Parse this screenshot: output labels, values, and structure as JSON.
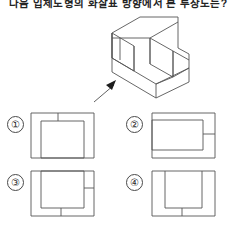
{
  "header": {
    "text": "다음 입체도형의 화살표 방향에서 본 투상도는?"
  },
  "figure": {
    "caption_icon": "isometric-solid",
    "arrow_icon": "view-direction-arrow"
  },
  "options": [
    {
      "marker": "①",
      "name": "option-1",
      "description": "rectangle with inner rectangle and short vertical line at top center"
    },
    {
      "marker": "②",
      "name": "option-2",
      "description": "rectangle with inner rectangle open to the left and short horizontal line at right"
    },
    {
      "marker": "③",
      "name": "option-3",
      "description": "rectangle with inner square, short horizontal line at right and short vertical line at bottom"
    },
    {
      "marker": "④",
      "name": "option-4",
      "description": "rectangle with inner U shape and short vertical line at bottom center"
    }
  ]
}
